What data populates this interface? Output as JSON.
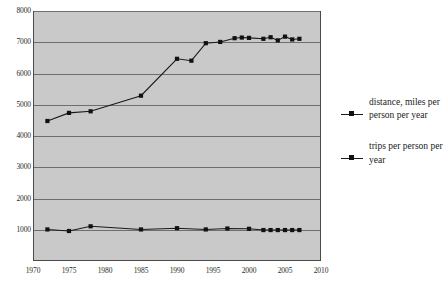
{
  "chart_data": {
    "type": "line",
    "title": "",
    "xlabel": "",
    "ylabel": "",
    "xlim": [
      1970,
      2010
    ],
    "ylim": [
      0,
      8000
    ],
    "grid": true,
    "legend_position": "right",
    "x_ticks": [
      "1970",
      "1975",
      "1980",
      "1985",
      "1990",
      "1995",
      "2000",
      "2005",
      "2010"
    ],
    "y_ticks": [
      "1000",
      "2000",
      "3000",
      "4000",
      "5000",
      "6000",
      "7000",
      "8000"
    ],
    "series": [
      {
        "name": "distance, miles per person per year",
        "x": [
          1972,
          1975,
          1978,
          1985,
          1990,
          1992,
          1994,
          1996,
          1998,
          1999,
          2000,
          2002,
          2003,
          2004,
          2005,
          2006,
          2007
        ],
        "values": [
          4480,
          4740,
          4790,
          5290,
          6470,
          6410,
          6970,
          7010,
          7130,
          7150,
          7140,
          7110,
          7160,
          7060,
          7180,
          7090,
          7110
        ]
      },
      {
        "name": "trips per person per year",
        "x": [
          1972,
          1975,
          1978,
          1985,
          1990,
          1994,
          1997,
          2000,
          2002,
          2003,
          2004,
          2005,
          2006,
          2007
        ],
        "values": [
          1010,
          960,
          1110,
          1010,
          1050,
          1010,
          1040,
          1030,
          990,
          990,
          990,
          990,
          990,
          990
        ]
      }
    ]
  },
  "legend": {
    "entries": [
      {
        "label": "distance, miles per person per year"
      },
      {
        "label": "trips per person per year"
      }
    ]
  },
  "caption": {
    "text": ""
  }
}
